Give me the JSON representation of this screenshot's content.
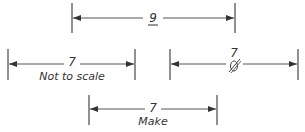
{
  "diagram": {
    "dimensions": [
      {
        "id": "top",
        "value": "9",
        "underlined": true,
        "note": "",
        "x1": 72,
        "x2": 235,
        "y": 18,
        "top": 3,
        "bottom": 33
      },
      {
        "id": "left",
        "value": "7",
        "note": "Not to scale",
        "x1": 8,
        "x2": 135,
        "y": 64,
        "top": 49,
        "bottom": 80
      },
      {
        "id": "right",
        "value": "7",
        "note": "",
        "struck": true,
        "x1": 170,
        "x2": 298,
        "y": 64,
        "top": 49,
        "bottom": 80
      },
      {
        "id": "bottom",
        "value": "7",
        "note": "Make",
        "x1": 89,
        "x2": 217,
        "y": 109,
        "top": 95,
        "bottom": 125
      }
    ],
    "colors": {
      "line": "#444444",
      "text": "#333333"
    }
  }
}
